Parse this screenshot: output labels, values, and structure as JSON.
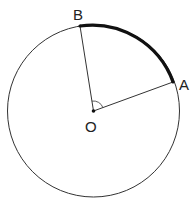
{
  "diagram": {
    "type": "geometry-circle-sector",
    "center": {
      "label": "O",
      "x": 93.5,
      "y": 111
    },
    "radius": 86,
    "points": [
      {
        "label": "A",
        "x": 173,
        "y": 82
      },
      {
        "label": "B",
        "x": 80,
        "y": 26
      }
    ],
    "segments": [
      {
        "from": "O",
        "to": "A"
      },
      {
        "from": "O",
        "to": "B"
      }
    ],
    "highlighted_arc": {
      "from": "B",
      "to": "A",
      "style": "bold"
    },
    "angle_mark": {
      "vertex": "O",
      "between": [
        "A",
        "B"
      ]
    },
    "colors": {
      "stroke": "#222222",
      "background": "#ffffff"
    }
  },
  "labels": {
    "center": "O",
    "point_a": "A",
    "point_b": "B"
  }
}
